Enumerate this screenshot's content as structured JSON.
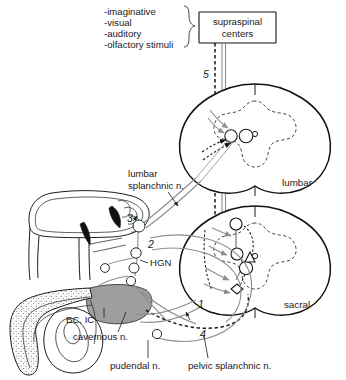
{
  "figure": {
    "background_color": "#ffffff",
    "ink_color": "#1c1c1c",
    "gray_nerve_color": "#8d8d8d",
    "muscle_fill_color": "#9e9e9e"
  },
  "stimuli": {
    "items": [
      "-imaginative",
      "-visual",
      "-auditory",
      "-olfactory stimuli"
    ]
  },
  "supraspinal_box": {
    "line1": "supraspinal",
    "line2": "centers"
  },
  "pathway_numbers": {
    "n1": "1",
    "n2": "2",
    "n3": "3",
    "n4": "4",
    "n5": "5"
  },
  "cord_sections": [
    {
      "label": "lumbar"
    },
    {
      "label": "sacral"
    }
  ],
  "labels": {
    "lumbar_splanchnic_line1": "lumbar",
    "lumbar_splanchnic_line2": "splanchnic n.",
    "hgn": "HGN",
    "bc_ic": "BC, IC",
    "cavernous": "cavernous n.",
    "pudendal": "pudendal n.",
    "pelvic_splanchnic": "pelvic splanchnic n."
  }
}
